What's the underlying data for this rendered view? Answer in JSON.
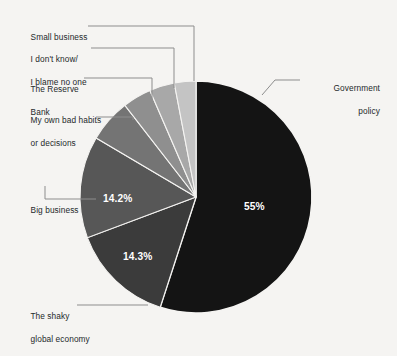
{
  "chart_data": {
    "type": "pie",
    "title": "",
    "subtitle": "",
    "xlabel": "",
    "ylabel": "",
    "legend_position": "callout-labels",
    "grid": false,
    "total": 100,
    "categories": [
      "Government policy",
      "The shaky global economy",
      "Big business",
      "My own bad habits or decisions",
      "The Reserve Bank",
      "I don't know/ I blame no one",
      "Small business"
    ],
    "values": [
      55,
      14.3,
      14.2,
      6.0,
      4.0,
      3.5,
      3.0
    ],
    "slices": [
      {
        "label": "Government policy",
        "label_line1": "Government",
        "label_line2": "policy",
        "value": 55,
        "value_text": "55%",
        "color": "#141414",
        "show_value": true
      },
      {
        "label": "The shaky global economy",
        "label_line1": "The shaky",
        "label_line2": "global economy",
        "value": 14.3,
        "value_text": "14.3%",
        "color": "#3b3b3b",
        "show_value": true
      },
      {
        "label": "Big business",
        "label_line1": "Big business",
        "label_line2": "",
        "value": 14.2,
        "value_text": "14.2%",
        "color": "#575757",
        "show_value": true
      },
      {
        "label": "My own bad habits or decisions",
        "label_line1": "My own bad habits",
        "label_line2": "or decisions",
        "value": 6.0,
        "value_text": "",
        "color": "#747474",
        "show_value": false
      },
      {
        "label": "The Reserve Bank",
        "label_line1": "The Reserve",
        "label_line2": "Bank",
        "value": 4.0,
        "value_text": "",
        "color": "#8f8f8f",
        "show_value": false
      },
      {
        "label": "I don't know/ I blame no one",
        "label_line1": "I don't know/",
        "label_line2": "I blame no one",
        "value": 3.5,
        "value_text": "",
        "color": "#a8a8a8",
        "show_value": false
      },
      {
        "label": "Small business",
        "label_line1": "Small business",
        "label_line2": "",
        "value": 3.0,
        "value_text": "",
        "color": "#c4c4c4",
        "show_value": false
      }
    ],
    "colors": {
      "background": "#f5f4f2",
      "label_text": "#24292b",
      "value_text": "#ffffff",
      "leader_line": "#8d8d8d",
      "slice_gap": "#f5f4f2"
    }
  }
}
